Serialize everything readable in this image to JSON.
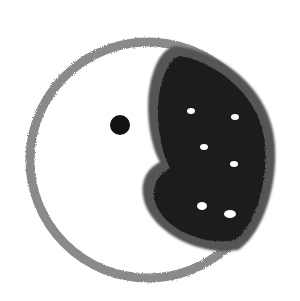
{
  "drawing": {
    "subject": "hand-drawn circle with dark crescent shape, dot and white specks",
    "colors": {
      "background": "#ffffff",
      "outline": "#8a8a8a",
      "fill_dark": "#1a1a1a",
      "fill_edge": "#555555",
      "speck": "#ffffff"
    }
  }
}
